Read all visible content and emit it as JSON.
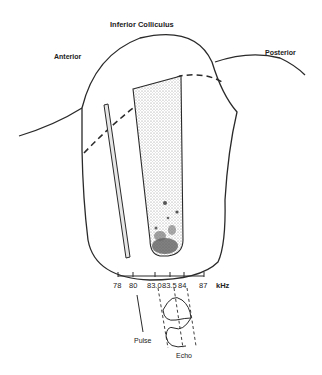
{
  "title": "Inferior Colliculus",
  "orientation": {
    "anterior": "Anterior",
    "posterior": "Posterior"
  },
  "frequency_axis": {
    "unit": "kHz",
    "ticks": [
      "78",
      "80",
      "83.0",
      "83.5",
      "84",
      "87"
    ]
  },
  "signals": {
    "pulse": "Pulse",
    "echo": "Echo"
  },
  "colors": {
    "ink": "#2a2a2a",
    "stipple": "#c8c8c8",
    "dense": "#555555"
  }
}
